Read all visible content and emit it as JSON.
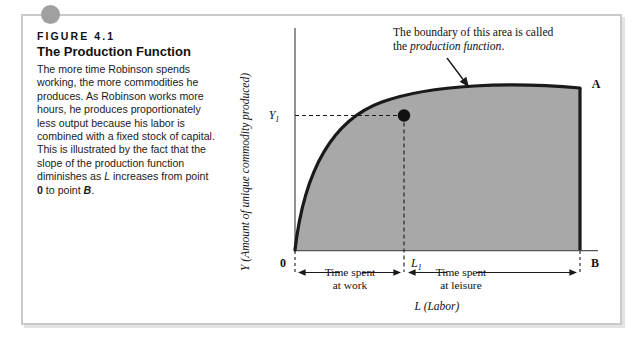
{
  "figure": {
    "number": "FIGURE 4.1",
    "title": "The Production Function",
    "body_html": "The more time Robinson spends working, the more commodities he produces. As Robinson works more hours, he produces proportionately less output because his labor is combined with a fixed stock of capital. This is illustrated by the fact that the slope of the production function diminishes as <i>L</i> increases from point <b>0</b> to point <b class=\"ital\">B</b>."
  },
  "chart_data": {
    "type": "area",
    "title": "The Production Function",
    "xlabel": "L (Labor)",
    "ylabel": "Y (Amount of unique commodity produced)",
    "xlim": [
      0,
      1
    ],
    "ylim": [
      0,
      1
    ],
    "grid": false,
    "legend": "none",
    "series": [
      {
        "name": "production function",
        "description": "Concave increasing curve from origin 0 to point A; area beneath it is shaded gray.",
        "x": [
          0.0,
          0.05,
          0.1,
          0.15,
          0.2,
          0.3,
          0.4,
          0.5,
          0.6,
          0.7,
          0.8,
          0.9,
          1.0
        ],
        "y": [
          0.0,
          0.23,
          0.36,
          0.46,
          0.54,
          0.67,
          0.77,
          0.84,
          0.9,
          0.94,
          0.97,
          0.99,
          1.0
        ]
      }
    ],
    "points": [
      {
        "name": "origin",
        "label": "0",
        "x": 0.0,
        "y": 0.0
      },
      {
        "name": "operating-point",
        "label": "",
        "x": 0.4,
        "y": 0.77,
        "marker": "filled-circle"
      },
      {
        "name": "point-A",
        "label": "A",
        "x": 1.0,
        "y": 1.0
      },
      {
        "name": "point-B",
        "label": "B",
        "x": 1.0,
        "y": 0.0
      }
    ],
    "reference_lines": [
      {
        "name": "Y1-guideline",
        "orientation": "horizontal",
        "value": 0.77,
        "label": "Y1",
        "style": "dashed"
      },
      {
        "name": "L1-guideline",
        "orientation": "vertical",
        "value": 0.4,
        "label": "L1",
        "style": "dashed"
      }
    ],
    "annotations": [
      {
        "name": "boundary-note",
        "line1": "The boundary of this area is called",
        "line2_prefix": "the ",
        "line2_italic": "production function",
        "line2_suffix": ".",
        "arrow": "points down-right to the curve"
      }
    ],
    "brackets": [
      {
        "name": "time-at-work",
        "line1": "Time spent",
        "line2": "at work",
        "from": 0.0,
        "to": 0.4
      },
      {
        "name": "time-at-leisure",
        "line1": "Time spent",
        "line2": "at leisure",
        "from": 0.4,
        "to": 1.0
      }
    ],
    "tick_labels": {
      "x": [
        "0",
        "L1",
        "B"
      ],
      "y": [
        "Y1"
      ]
    },
    "colors": {
      "area_fill": "#a8a8a8",
      "curve": "#1a1a1a",
      "axis": "#555555",
      "frame": "#c9c9c9",
      "dot": "#a0a0a0",
      "text": "#111111"
    }
  },
  "labels": {
    "y_axis": "Y (Amount of unique commodity produced)",
    "x_axis": "L (Labor)",
    "y1": "Y",
    "y1_sub": "1",
    "l1": "L",
    "l1_sub": "1",
    "zero": "0",
    "point_a": "A",
    "point_b": "B",
    "note_line1": "The boundary of this area is called",
    "note_line2_pre": "the ",
    "note_line2_em": "production function",
    "note_line2_post": ".",
    "work_line1": "Time spent",
    "work_line2": "at work",
    "leisure_line1": "Time spent",
    "leisure_line2": "at leisure"
  }
}
